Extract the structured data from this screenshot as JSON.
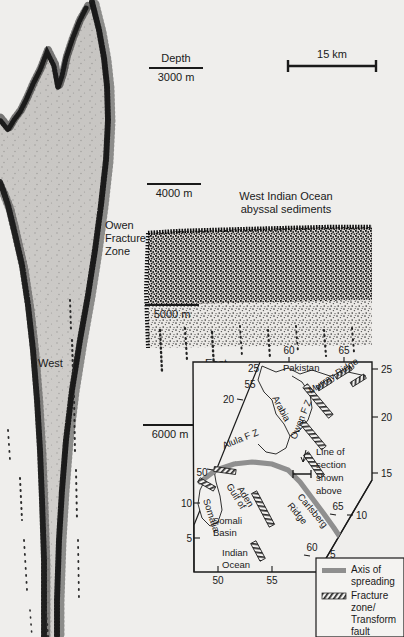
{
  "figure": {
    "type": "seismic-reflection-profile-with-inset-map",
    "background_color": "#efeeec",
    "ink_color": "#1a1a1a"
  },
  "profile": {
    "scale_bar": {
      "label": "15 km"
    },
    "depth_axis": {
      "title": "Depth",
      "ticks": [
        {
          "label": "3000 m"
        },
        {
          "label": "4000 m"
        },
        {
          "label": "5000 m"
        },
        {
          "label": "6000 m"
        }
      ]
    },
    "annotations": [
      {
        "name": "owen-fracture-zone",
        "lines": [
          "Owen",
          "Fracture",
          "Zone"
        ]
      },
      {
        "name": "abyssal-sediments",
        "lines": [
          "West Indian Ocean",
          "abyssal sediments"
        ]
      },
      {
        "name": "direction-west",
        "text": "West"
      },
      {
        "name": "direction-east",
        "text": "East"
      }
    ]
  },
  "inset_map": {
    "region_labels": [
      {
        "name": "pakistan",
        "text": "Pakistan"
      },
      {
        "name": "arabia",
        "text": "Arabia"
      },
      {
        "name": "somalia",
        "text": "Somalia"
      },
      {
        "name": "gulf-of-aden",
        "lines": [
          "Gulf of",
          "Aden"
        ]
      },
      {
        "name": "somali-basin",
        "lines": [
          "Somali",
          "Basin"
        ]
      },
      {
        "name": "indian-ocean",
        "lines": [
          "Indian",
          "Ocean"
        ]
      },
      {
        "name": "murray-ridge",
        "text": "Murray Ridge"
      },
      {
        "name": "owen-fz",
        "text": "Owen F Z"
      },
      {
        "name": "alula-fz",
        "text": "Alula F Z"
      },
      {
        "name": "carlsberg-ridge",
        "lines": [
          "Carlsberg",
          "Ridge"
        ]
      }
    ],
    "section_marker": {
      "lines": [
        "Line of",
        "section",
        "shown",
        "above"
      ]
    },
    "latitude_ticks_left": [
      "20",
      "10",
      "5"
    ],
    "latitude_ticks_right": [
      "25",
      "20",
      "15",
      "10",
      "5"
    ],
    "longitude_ticks_top": [
      "60",
      "65"
    ],
    "longitude_ticks_bottom": [
      "50",
      "55"
    ],
    "longitude_ticks_diagonal_left": [
      "55",
      "50"
    ],
    "longitude_ticks_diagonal_right": [
      "65",
      "60"
    ],
    "corner_tick_top_left": "25",
    "legend": {
      "items": [
        {
          "name": "axis-of-spreading",
          "lines": [
            "Axis of",
            "spreading"
          ],
          "symbol": "thick-gray-line",
          "color": "#8a8a8a"
        },
        {
          "name": "fracture-zone",
          "lines": [
            "Fracture",
            "zone/",
            "Transform",
            "fault"
          ],
          "symbol": "hatched-band"
        }
      ]
    }
  }
}
